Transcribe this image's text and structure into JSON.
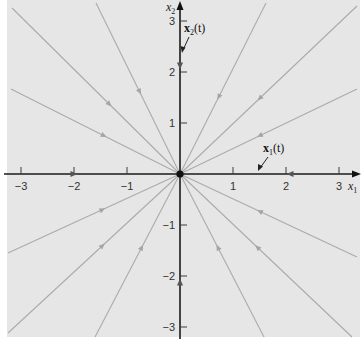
{
  "figure": {
    "colors": {
      "panel": "#e6e6e6",
      "trajectory": "#ababab",
      "axis": "#1a1a1a"
    },
    "origin_px": [
      180,
      174
    ],
    "units_px": {
      "x": 53,
      "y": 51
    },
    "axes": {
      "x": {
        "label": "x",
        "label_sub": "1",
        "ticks": [
          {
            "value": -3,
            "label": "−3"
          },
          {
            "value": -2,
            "label": "−2"
          },
          {
            "value": -1,
            "label": "−1"
          },
          {
            "value": 1,
            "label": "1"
          },
          {
            "value": 2,
            "label": "2"
          },
          {
            "value": 3,
            "label": "3"
          }
        ],
        "range": [
          -3.3,
          3.4
        ]
      },
      "y": {
        "label": "x",
        "label_sub": "2",
        "ticks": [
          {
            "value": 3,
            "label": "3"
          },
          {
            "value": 2,
            "label": "2"
          },
          {
            "value": 1,
            "label": "1"
          },
          {
            "value": -1,
            "label": "−1"
          },
          {
            "value": -2,
            "label": "−2"
          },
          {
            "value": -3,
            "label": "−3"
          }
        ],
        "range": [
          -3.2,
          3.4
        ]
      }
    },
    "annotations": {
      "x1t": {
        "bold": "x",
        "sub": "1",
        "rest": "(t)"
      },
      "x2t": {
        "bold": "x",
        "sub": "2",
        "rest": "(t)"
      }
    },
    "trajectories": [
      {
        "from": [
          12,
          8
        ],
        "arrow_t": 0.58
      },
      {
        "from": [
          96,
          3
        ],
        "arrow_t": 0.52
      },
      {
        "from": [
          11,
          89
        ],
        "arrow_t": 0.55
      },
      {
        "from": [
          266,
          3
        ],
        "arrow_t": 0.55
      },
      {
        "from": [
          357,
          6
        ],
        "arrow_t": 0.55
      },
      {
        "from": [
          357,
          89
        ],
        "arrow_t": 0.55
      },
      {
        "from": [
          8,
          253
        ],
        "arrow_t": 0.55
      },
      {
        "from": [
          8,
          333
        ],
        "arrow_t": 0.55
      },
      {
        "from": [
          95,
          337
        ],
        "arrow_t": 0.55
      },
      {
        "from": [
          264,
          337
        ],
        "arrow_t": 0.55
      },
      {
        "from": [
          352,
          337
        ],
        "arrow_t": 0.55
      },
      {
        "from": [
          357,
          257
        ],
        "arrow_t": 0.55
      }
    ],
    "axis_flow_arrows": [
      {
        "at": [
          74,
          174
        ],
        "dir": "right"
      },
      {
        "at": [
          290,
          174
        ],
        "dir": "left"
      },
      {
        "at": [
          180,
          66
        ],
        "dir": "down"
      },
      {
        "at": [
          180,
          282
        ],
        "dir": "up"
      }
    ]
  }
}
